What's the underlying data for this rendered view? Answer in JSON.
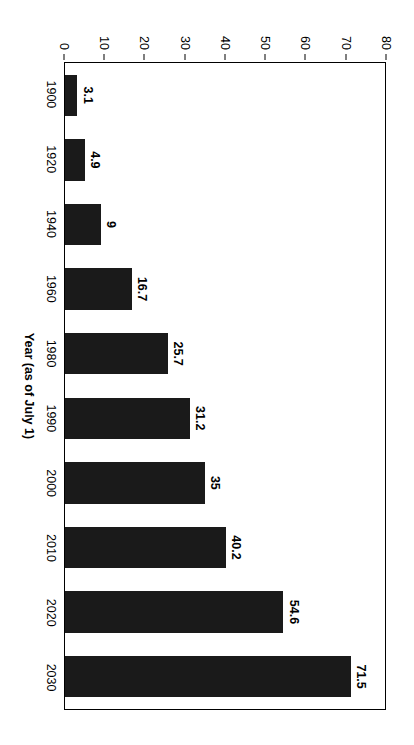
{
  "chart_data": {
    "type": "bar",
    "title": "",
    "xlabel": "Year (as of July 1)",
    "ylabel": "",
    "categories": [
      "1900",
      "1920",
      "1940",
      "1960",
      "1980",
      "1990",
      "2000",
      "2010",
      "2020",
      "2030"
    ],
    "values": [
      3.1,
      4.9,
      9,
      16.7,
      25.7,
      31.2,
      35,
      40.2,
      54.6,
      71.5
    ],
    "value_labels": [
      "3.1",
      "4.9",
      "9",
      "16.7",
      "25.7",
      "31.2",
      "35",
      "40.2",
      "54.6",
      "71.5"
    ],
    "ylim": [
      0,
      80
    ],
    "yticks": [
      0,
      10,
      20,
      30,
      40,
      50,
      60,
      70,
      80
    ],
    "ytick_labels": [
      "0",
      "10",
      "20",
      "30",
      "40",
      "50",
      "60",
      "70",
      "80"
    ],
    "grid": false,
    "legend": false,
    "orientation": "rotated-90-clockwise",
    "bar_color": "#1a1a1a",
    "plot_border_color": "#000000",
    "background_color": "#ffffff",
    "data_labels_shown": true
  },
  "axis": {
    "category_title": "Year (as of July 1)"
  }
}
